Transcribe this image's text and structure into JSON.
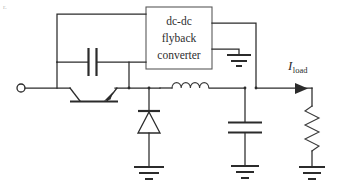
{
  "diagram": {
    "type": "circuit-schematic",
    "background_color": "#ffffff",
    "line_color": "#2b2b2b",
    "corner_artifact": "r."
  },
  "converter_block": {
    "line1": "dc-dc",
    "line2": "flyback",
    "line3": "converter"
  },
  "labels": {
    "load_current_symbol": "I",
    "load_current_subscript": "load"
  },
  "components": [
    {
      "name": "input-terminal",
      "icon": "open-circle-terminal",
      "label": ""
    },
    {
      "name": "transistor",
      "icon": "bjt-transistor-icon",
      "label": ""
    },
    {
      "name": "snubber-capacitor",
      "icon": "capacitor-icon",
      "label": ""
    },
    {
      "name": "freewheeling-diode",
      "icon": "diode-icon",
      "label": ""
    },
    {
      "name": "filter-inductor",
      "icon": "inductor-icon",
      "label": ""
    },
    {
      "name": "output-capacitor",
      "icon": "capacitor-icon",
      "label": ""
    },
    {
      "name": "load-resistor",
      "icon": "resistor-icon",
      "label": ""
    },
    {
      "name": "ground-converter",
      "icon": "ground-icon",
      "label": ""
    },
    {
      "name": "ground-diode",
      "icon": "ground-icon",
      "label": ""
    },
    {
      "name": "ground-output-capacitor",
      "icon": "ground-icon",
      "label": ""
    },
    {
      "name": "ground-load",
      "icon": "ground-icon",
      "label": ""
    }
  ]
}
